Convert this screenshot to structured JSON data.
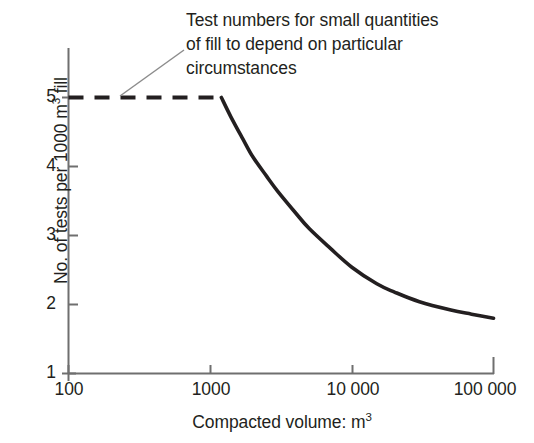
{
  "chart_data": {
    "type": "line",
    "title": "",
    "subtitle": "",
    "xlabel": "Compacted volume: m",
    "xlabel_sup": "3",
    "ylabel_pre": "No. of tests per 1000 m",
    "ylabel_sup": "3",
    "ylabel_post": " fill",
    "xscale": "log",
    "yscale": "linear",
    "xlim": [
      100,
      100000
    ],
    "ylim": [
      1,
      5
    ],
    "grid": false,
    "legend": null,
    "xticks": [
      {
        "value": 100,
        "label": "100"
      },
      {
        "value": 1000,
        "label": "1000"
      },
      {
        "value": 10000,
        "label": "10 000"
      },
      {
        "value": 100000,
        "label": "100 000"
      }
    ],
    "yticks": [
      {
        "value": 1,
        "label": "1"
      },
      {
        "value": 2,
        "label": "2"
      },
      {
        "value": 3,
        "label": "3"
      },
      {
        "value": 4,
        "label": "4"
      },
      {
        "value": 5,
        "label": "5"
      }
    ],
    "series": [
      {
        "name": "Test rate plateau",
        "style": "dashed",
        "color": "#231f20",
        "points": [
          {
            "x": 100,
            "y": 5
          },
          {
            "x": 1200,
            "y": 5
          }
        ]
      },
      {
        "name": "Test rate decay",
        "style": "solid",
        "color": "#231f20",
        "points": [
          {
            "x": 1200,
            "y": 5.0
          },
          {
            "x": 1400,
            "y": 4.72
          },
          {
            "x": 1700,
            "y": 4.4
          },
          {
            "x": 2000,
            "y": 4.14
          },
          {
            "x": 2500,
            "y": 3.86
          },
          {
            "x": 3000,
            "y": 3.64
          },
          {
            "x": 4000,
            "y": 3.33
          },
          {
            "x": 5000,
            "y": 3.1
          },
          {
            "x": 7000,
            "y": 2.82
          },
          {
            "x": 10000,
            "y": 2.54
          },
          {
            "x": 15000,
            "y": 2.3
          },
          {
            "x": 20000,
            "y": 2.18
          },
          {
            "x": 30000,
            "y": 2.04
          },
          {
            "x": 50000,
            "y": 1.92
          },
          {
            "x": 70000,
            "y": 1.86
          },
          {
            "x": 100000,
            "y": 1.8
          }
        ]
      }
    ],
    "annotations": [
      {
        "name": "plateau-note",
        "lines": [
          "Test numbers for small quantities",
          "of fill to depend on particular",
          "circumstances"
        ],
        "leader_from": {
          "x": 460,
          "y": 5.0
        },
        "leader_to_px": {
          "x": 182,
          "y": 50
        }
      }
    ]
  },
  "axes": {
    "axis_color": "#6f6f6f",
    "line_color": "#231f20",
    "tick_inward": true
  }
}
